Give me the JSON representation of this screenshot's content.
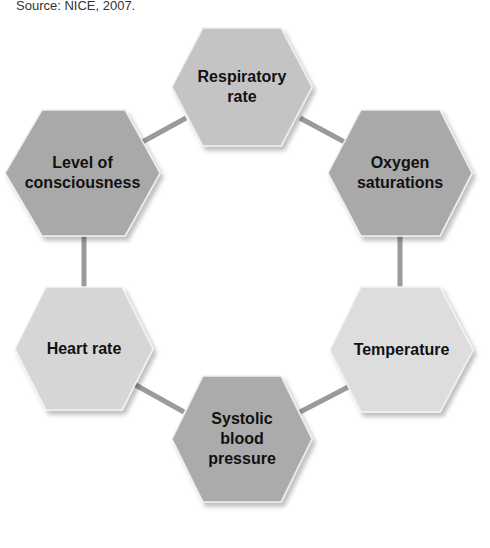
{
  "source": "Source: NICE, 2007.",
  "colors": {
    "dark": "#a9a9a9",
    "medium": "#c4c4c4",
    "light": "#dcdcdc",
    "connector": "#9a9a9a"
  },
  "nodes": [
    {
      "id": "respiratory-rate",
      "label": "Respiratory rate",
      "lines": [
        "Respiratory",
        "rate"
      ],
      "shade": "medium"
    },
    {
      "id": "oxygen-saturations",
      "label": "Oxygen saturations",
      "lines": [
        "Oxygen",
        "saturations"
      ],
      "shade": "dark"
    },
    {
      "id": "temperature",
      "label": "Temperature",
      "lines": [
        "Temperature"
      ],
      "shade": "light"
    },
    {
      "id": "systolic-blood-pressure",
      "label": "Systolic blood pressure",
      "lines": [
        "Systolic",
        "blood",
        "pressure"
      ],
      "shade": "dark"
    },
    {
      "id": "heart-rate",
      "label": "Heart rate",
      "lines": [
        "Heart rate"
      ],
      "shade": "light"
    },
    {
      "id": "level-of-consciousness",
      "label": "Level of consciousness",
      "lines": [
        "Level of",
        "consciousness"
      ],
      "shade": "dark"
    }
  ],
  "edges": [
    [
      "respiratory-rate",
      "oxygen-saturations"
    ],
    [
      "oxygen-saturations",
      "temperature"
    ],
    [
      "temperature",
      "systolic-blood-pressure"
    ],
    [
      "systolic-blood-pressure",
      "heart-rate"
    ],
    [
      "heart-rate",
      "level-of-consciousness"
    ],
    [
      "level-of-consciousness",
      "respiratory-rate"
    ]
  ]
}
